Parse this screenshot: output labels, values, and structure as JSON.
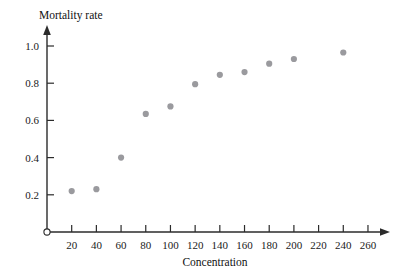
{
  "chart_data": {
    "type": "scatter",
    "title": "",
    "xlabel": "Concentration",
    "ylabel": "Mortality rate",
    "grid": false,
    "legend": null,
    "xlim": [
      0,
      270
    ],
    "ylim": [
      0,
      1.06
    ],
    "xticks": [
      20,
      40,
      60,
      80,
      100,
      120,
      140,
      160,
      180,
      200,
      220,
      240,
      260
    ],
    "xtick_labels": [
      "20",
      "40",
      "60",
      "80",
      "100",
      "120",
      "140",
      "160",
      "180",
      "200",
      "220",
      "240",
      "260"
    ],
    "yticks": [
      0.2,
      0.4,
      0.6,
      0.8,
      1.0
    ],
    "ytick_labels": [
      "0.2",
      "0.4",
      "0.6",
      "0.8",
      "1.0"
    ],
    "origin_marker": "open-circle",
    "x": [
      20,
      40,
      60,
      80,
      100,
      120,
      140,
      160,
      180,
      200,
      240
    ],
    "y": [
      0.22,
      0.23,
      0.4,
      0.635,
      0.675,
      0.795,
      0.845,
      0.86,
      0.905,
      0.93,
      0.965
    ],
    "points": [
      {
        "x": 20,
        "y": 0.22
      },
      {
        "x": 40,
        "y": 0.23
      },
      {
        "x": 60,
        "y": 0.4
      },
      {
        "x": 80,
        "y": 0.635
      },
      {
        "x": 100,
        "y": 0.675
      },
      {
        "x": 120,
        "y": 0.795
      },
      {
        "x": 140,
        "y": 0.845
      },
      {
        "x": 160,
        "y": 0.86
      },
      {
        "x": 180,
        "y": 0.905
      },
      {
        "x": 200,
        "y": 0.93
      },
      {
        "x": 240,
        "y": 0.965
      }
    ],
    "marker_color": "#9a9a9e",
    "marker_size": 3.1,
    "axis_color": "#2b2b2b"
  },
  "figure": {
    "y_axis_title": "Mortality rate",
    "x_axis_title": "Concentration"
  },
  "geometry": {
    "origin_px": {
      "x": 47,
      "y": 232
    },
    "x_px_per_unit": 1.2345,
    "y_px_per_unit": 186.0,
    "x_axis_end_px": 390,
    "y_axis_top_px": 30
  }
}
